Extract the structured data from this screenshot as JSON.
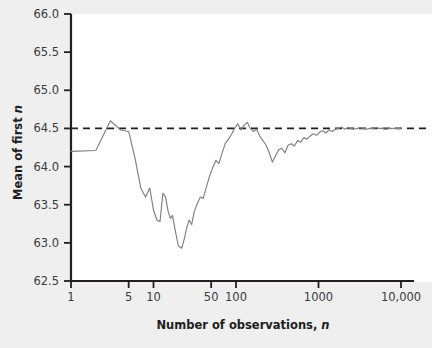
{
  "figure": {
    "background_color": "#efeff0",
    "plot_background_color": "#ffffff",
    "axis_color": "#231f20",
    "series_color": "#7f7f85",
    "reference_line_color": "#231f20"
  },
  "axes": {
    "y_label_main": "Mean of first ",
    "y_label_italic": "n",
    "x_label_main": "Number of observations, ",
    "x_label_italic": "n"
  },
  "chart_data": {
    "type": "line",
    "title": "",
    "subtitle": "",
    "xlabel": "Number of observations, n",
    "ylabel": "Mean of first n",
    "xscale": "log",
    "xlim": [
      1,
      10000
    ],
    "ylim": [
      62.5,
      66.0
    ],
    "grid": false,
    "legend_position": "none",
    "xticks": [
      1,
      5,
      10,
      50,
      100,
      1000,
      10000
    ],
    "xtick_labels": [
      "1",
      "5",
      "10",
      "50",
      "100",
      "1000",
      "10,000"
    ],
    "yticks": [
      62.5,
      63.0,
      63.5,
      64.0,
      64.5,
      65.0,
      65.5,
      66.0
    ],
    "ytick_labels": [
      "62.5",
      "63.0",
      "63.5",
      "64.0",
      "64.5",
      "65.0",
      "65.5",
      "66.0"
    ],
    "annotations": [
      {
        "type": "hline",
        "y": 64.5,
        "style": "dashed",
        "label": "Population mean 64.5"
      }
    ],
    "series": [
      {
        "name": "Running mean of first n observations",
        "style": "line",
        "x": [
          1,
          2,
          3,
          4,
          5,
          6,
          7,
          8,
          9,
          10,
          11,
          12,
          13,
          14,
          15,
          16,
          17,
          18,
          19,
          20,
          22,
          24,
          25,
          27,
          29,
          31,
          34,
          37,
          40,
          44,
          48,
          52,
          57,
          62,
          68,
          74,
          81,
          88,
          96,
          105,
          115,
          125,
          137,
          149,
          163,
          178,
          194,
          212,
          232,
          253,
          276,
          301,
          329,
          359,
          392,
          428,
          467,
          510,
          557,
          608,
          664,
          725,
          791,
          864,
          943,
          1030,
          1124,
          1227,
          1340,
          1463,
          1597,
          1743,
          1903,
          2077,
          2267,
          2475,
          2702,
          2950,
          3220,
          3515,
          3837,
          4189,
          4573,
          4992,
          5449,
          5949,
          6494,
          7089,
          7739,
          8448,
          9222,
          10000
        ],
        "y": [
          64.2,
          64.21,
          64.6,
          64.48,
          64.46,
          64.1,
          63.72,
          63.6,
          63.72,
          63.43,
          63.3,
          63.28,
          63.65,
          63.6,
          63.42,
          63.32,
          63.36,
          63.21,
          63.08,
          62.96,
          62.93,
          63.08,
          63.18,
          63.3,
          63.24,
          63.4,
          63.52,
          63.6,
          63.58,
          63.74,
          63.88,
          63.98,
          64.08,
          64.04,
          64.18,
          64.3,
          64.36,
          64.42,
          64.5,
          64.56,
          64.48,
          64.54,
          64.58,
          64.5,
          64.46,
          64.49,
          64.4,
          64.34,
          64.28,
          64.18,
          64.06,
          64.14,
          64.22,
          64.24,
          64.18,
          64.28,
          64.3,
          64.27,
          64.34,
          64.32,
          64.38,
          64.36,
          64.4,
          64.43,
          64.41,
          64.45,
          64.47,
          64.44,
          64.48,
          64.46,
          64.49,
          64.5,
          64.52,
          64.49,
          64.51,
          64.5,
          64.49,
          64.5,
          64.51,
          64.5,
          64.49,
          64.5,
          64.5,
          64.51,
          64.5,
          64.5,
          64.49,
          64.5,
          64.5,
          64.5,
          64.5,
          64.5
        ]
      }
    ]
  }
}
